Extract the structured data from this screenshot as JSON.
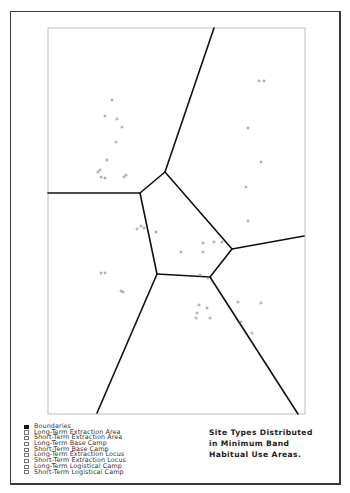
{
  "map": {
    "outer_frame": {
      "x": 10,
      "y": 11,
      "w": 331,
      "h": 474
    },
    "inner_frame": {
      "x": 48,
      "y": 28,
      "w": 257,
      "h": 386
    },
    "colors": {
      "boundary": "#111111",
      "site": "#8a8a8a",
      "frame": "#3a3a3a",
      "inner_frame": "#b0b0b0"
    },
    "boundaries": [
      [
        [
          214,
          28
        ],
        [
          165,
          172
        ]
      ],
      [
        [
          48,
          193
        ],
        [
          140,
          193
        ]
      ],
      [
        [
          140,
          193
        ],
        [
          165,
          172
        ]
      ],
      [
        [
          165,
          172
        ],
        [
          232,
          249
        ]
      ],
      [
        [
          140,
          193
        ],
        [
          157,
          274
        ]
      ],
      [
        [
          157,
          274
        ],
        [
          210,
          277
        ]
      ],
      [
        [
          210,
          277
        ],
        [
          232,
          249
        ]
      ],
      [
        [
          232,
          249
        ],
        [
          304,
          236
        ]
      ],
      [
        [
          157,
          274
        ],
        [
          97,
          413
        ]
      ],
      [
        [
          210,
          277
        ],
        [
          298,
          414
        ]
      ]
    ],
    "sites": [
      [
        112,
        100
      ],
      [
        105,
        116
      ],
      [
        117,
        119
      ],
      [
        122,
        127
      ],
      [
        116,
        142
      ],
      [
        107,
        160
      ],
      [
        98,
        172
      ],
      [
        100,
        170
      ],
      [
        101,
        177
      ],
      [
        105,
        178
      ],
      [
        124,
        177
      ],
      [
        126,
        175
      ],
      [
        259,
        81
      ],
      [
        264,
        81
      ],
      [
        248,
        128
      ],
      [
        261,
        162
      ],
      [
        246,
        187
      ],
      [
        248,
        221
      ],
      [
        137,
        229
      ],
      [
        141,
        226
      ],
      [
        144,
        228
      ],
      [
        156,
        232
      ],
      [
        181,
        252
      ],
      [
        203,
        243
      ],
      [
        203,
        252
      ],
      [
        214,
        242
      ],
      [
        222,
        242
      ],
      [
        200,
        275
      ],
      [
        208,
        278
      ],
      [
        101,
        273
      ],
      [
        105,
        273
      ],
      [
        121,
        291
      ],
      [
        123,
        292
      ],
      [
        199,
        305
      ],
      [
        197,
        313
      ],
      [
        207,
        308
      ],
      [
        196,
        318
      ],
      [
        210,
        318
      ],
      [
        238,
        302
      ],
      [
        261,
        303
      ],
      [
        241,
        322
      ],
      [
        252,
        333
      ]
    ]
  },
  "legend": {
    "items": [
      {
        "label": "Boundaries",
        "filled": true
      },
      {
        "label": "Long-Term Extraction Area",
        "filled": false
      },
      {
        "label": "Short-Term Extraction Area",
        "filled": false
      },
      {
        "label": "Long-Term Base Camp",
        "filled": false
      },
      {
        "label": "Short-Term Base Camp",
        "filled": false
      },
      {
        "label": "Long-Term Extraction Locus",
        "filled": false
      },
      {
        "label": "Short-Term Extraction Locus",
        "filled": false
      },
      {
        "label": "Long-Term Logistical Camp",
        "filled": false
      },
      {
        "label": "Short-Term Logistical Camp",
        "filled": false
      }
    ]
  },
  "title": {
    "lines": [
      "Site Types Distributed",
      "in Minimum Band",
      "Habitual Use Areas."
    ]
  }
}
